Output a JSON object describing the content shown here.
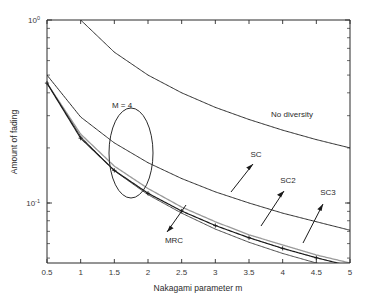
{
  "chart_data": {
    "type": "line",
    "title": "",
    "xlabel": "Nakagami parameter m",
    "ylabel": "Amount of fading",
    "xlim": [
      0.5,
      5
    ],
    "ylim": [
      0.04,
      1.0
    ],
    "yscale": "log",
    "xscale": "linear",
    "grid": false,
    "legend_position": "inline-annotations",
    "xticks": [
      "0.5",
      "1",
      "1.5",
      "2",
      "2.5",
      "3",
      "3.5",
      "4",
      "4.5",
      "5"
    ],
    "xtick_values": [
      0.5,
      1,
      1.5,
      2,
      2.5,
      3,
      3.5,
      4,
      4.5,
      5
    ],
    "yticks": [
      "10^0",
      "10^-1"
    ],
    "ytick_values": [
      1.0,
      0.1
    ],
    "x": [
      0.5,
      1,
      1.5,
      2,
      2.5,
      3,
      3.5,
      4,
      4.5,
      5
    ],
    "series": [
      {
        "name": "No diversity",
        "color": "#2b2b2b",
        "marker": "none",
        "values": [
          2.0,
          1.0,
          0.667,
          0.5,
          0.4,
          0.333,
          0.286,
          0.25,
          0.222,
          0.2
        ]
      },
      {
        "name": "SC",
        "color": "#2b2b2b",
        "marker": "none",
        "values": [
          0.5,
          0.295,
          0.213,
          0.166,
          0.136,
          0.115,
          0.1,
          0.088,
          0.079,
          0.071
        ]
      },
      {
        "name": "SC2",
        "color": "#9a9a9a",
        "marker": "none",
        "values": [
          0.452,
          0.238,
          0.159,
          0.12,
          0.095,
          0.079,
          0.067,
          0.059,
          0.052,
          0.047
        ]
      },
      {
        "name": "SC3",
        "color": "#4a4a4a",
        "marker": "none",
        "values": [
          0.452,
          0.231,
          0.15,
          0.111,
          0.088,
          0.072,
          0.061,
          0.053,
          0.047,
          0.042
        ]
      },
      {
        "name": "MRC",
        "color": "#1a1a1a",
        "marker": "plus",
        "values": [
          0.452,
          0.226,
          0.1507,
          0.113,
          0.0904,
          0.0753,
          0.0646,
          0.0565,
          0.0502,
          0.0452
        ]
      }
    ],
    "annotations": [
      {
        "label": "M = 4",
        "type": "text-with-ellipse"
      },
      {
        "label": "No diversity",
        "type": "text"
      },
      {
        "label": "SC",
        "type": "text-with-arrow"
      },
      {
        "label": "SC2",
        "type": "text-with-arrow"
      },
      {
        "label": "SC3",
        "type": "text-with-arrow"
      },
      {
        "label": "MRC",
        "type": "text-with-arrow"
      }
    ]
  },
  "axes": {
    "x_title": "Nakagami parameter m",
    "y_title": "Amount of fading",
    "x_ticks": [
      {
        "value": 0.5,
        "label": "0.5"
      },
      {
        "value": 1,
        "label": "1"
      },
      {
        "value": 1.5,
        "label": "1.5"
      },
      {
        "value": 2,
        "label": "2"
      },
      {
        "value": 2.5,
        "label": "2.5"
      },
      {
        "value": 3,
        "label": "3"
      },
      {
        "value": 3.5,
        "label": "3.5"
      },
      {
        "value": 4,
        "label": "4"
      },
      {
        "value": 4.5,
        "label": "4.5"
      },
      {
        "value": 5,
        "label": "5"
      }
    ],
    "y_ticks": [
      {
        "value": 1.0,
        "mantissa": "10",
        "exponent": "0"
      },
      {
        "value": 0.1,
        "mantissa": "10",
        "exponent": "-1"
      }
    ]
  },
  "annotations": {
    "m_equals": "M = 4",
    "no_diversity": "No diversity",
    "sc": "SC",
    "sc2": "SC2",
    "sc3": "SC3",
    "mrc": "MRC"
  },
  "colors": {
    "axis": "#2b2b2b",
    "curve_dark": "#2b2b2b",
    "curve_gray": "#9a9a9a",
    "curve_mid": "#4a4a4a",
    "background": "#ffffff"
  }
}
